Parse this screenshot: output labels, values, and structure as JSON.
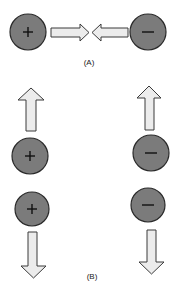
{
  "figure": {
    "panels": [
      {
        "label": "(A)",
        "description": "Opposite charges attract",
        "charges": [
          {
            "sign": "+",
            "symbol_name": "plus",
            "cx": 28,
            "cy": 32,
            "r": 18,
            "arrow_direction": "right"
          },
          {
            "sign": "−",
            "symbol_name": "minus",
            "cx": 148,
            "cy": 32,
            "r": 18,
            "arrow_direction": "left"
          }
        ]
      },
      {
        "label": "(B)",
        "description": "Like charges repel",
        "charges": [
          {
            "sign": "+",
            "symbol_name": "plus",
            "cx": 30,
            "cy": 156,
            "r": 18,
            "arrow_direction": "up"
          },
          {
            "sign": "+",
            "symbol_name": "plus",
            "cx": 32,
            "cy": 209,
            "r": 17,
            "arrow_direction": "down"
          },
          {
            "sign": "−",
            "symbol_name": "minus",
            "cx": 151,
            "cy": 153,
            "r": 18,
            "arrow_direction": "up"
          },
          {
            "sign": "−",
            "symbol_name": "minus",
            "cx": 148,
            "cy": 205,
            "r": 17,
            "arrow_direction": "down"
          }
        ]
      }
    ],
    "colors": {
      "charge_fill": "#7b7b7b",
      "charge_outline": "#2a2a2a",
      "arrow_fill": "#ececec",
      "arrow_outline": "#3a3a3a",
      "background": "#ffffff"
    }
  }
}
